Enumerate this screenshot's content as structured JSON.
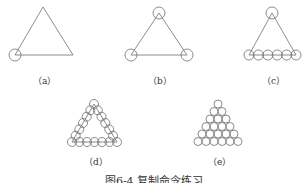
{
  "figure": {
    "caption": "图6-4  复制命令练习",
    "stroke_color": "#6e6e6e",
    "panels": [
      {
        "id": "a",
        "label": "（a）"
      },
      {
        "id": "b",
        "label": "（b）"
      },
      {
        "id": "c",
        "label": "（c）"
      },
      {
        "id": "d",
        "label": "（d）"
      },
      {
        "id": "e",
        "label": "（e）"
      }
    ]
  }
}
